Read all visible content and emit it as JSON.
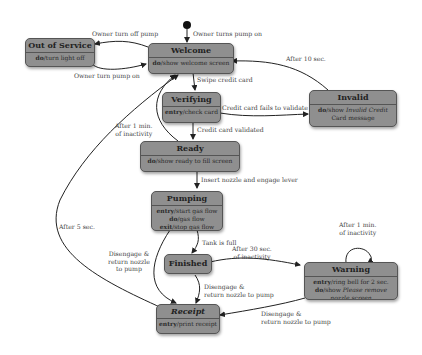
{
  "diagram": {
    "type": "state-machine",
    "initial_transition_label": "Owner turns pump on",
    "states": [
      {
        "id": "out_of_service",
        "name": "Out of Service",
        "actions": [
          {
            "kind": "do",
            "text": "turn light off"
          }
        ]
      },
      {
        "id": "welcome",
        "name": "Welcome",
        "actions": [
          {
            "kind": "do",
            "text": "show welcome screen"
          }
        ]
      },
      {
        "id": "verifying",
        "name": "Verifying",
        "actions": [
          {
            "kind": "entry",
            "text": "check card"
          }
        ]
      },
      {
        "id": "invalid",
        "name": "Invalid",
        "actions": [
          {
            "kind": "do",
            "text": "show ",
            "italic": "Invalid Credit Card",
            "suffix": " message"
          }
        ]
      },
      {
        "id": "ready",
        "name": "Ready",
        "actions": [
          {
            "kind": "do",
            "text": "show ready to fill screen"
          }
        ]
      },
      {
        "id": "pumping",
        "name": "Pumping",
        "actions": [
          {
            "kind": "entry",
            "text": "start gas flow"
          },
          {
            "kind": "do",
            "text": "gas flow"
          },
          {
            "kind": "exit",
            "text": "stop gas flow"
          }
        ]
      },
      {
        "id": "finished",
        "name": "Finished",
        "actions": []
      },
      {
        "id": "warning",
        "name": "Warning",
        "actions": [
          {
            "kind": "entry",
            "text": "ring bell for 2 sec."
          },
          {
            "kind": "do",
            "text": "show ",
            "italic": "Please remove nozzle screen"
          }
        ]
      },
      {
        "id": "receipt",
        "name": "Receipt",
        "actions": [
          {
            "kind": "entry",
            "text": "print receipt"
          }
        ]
      }
    ],
    "transitions": [
      {
        "from": "welcome",
        "to": "out_of_service",
        "label": "Owner turn off pump"
      },
      {
        "from": "out_of_service",
        "to": "welcome",
        "label": "Owner turn pump on"
      },
      {
        "from": "welcome",
        "to": "verifying",
        "label": "Swipe credit card"
      },
      {
        "from": "verifying",
        "to": "invalid",
        "label": "Credit card fails to validate"
      },
      {
        "from": "invalid",
        "to": "welcome",
        "label": "After 10 sec."
      },
      {
        "from": "verifying",
        "to": "ready",
        "label": "Credit card validated"
      },
      {
        "from": "ready",
        "to": "welcome",
        "label": "After 1 min. of inactivity"
      },
      {
        "from": "ready",
        "to": "pumping",
        "label": "Insert nozzle and engage lever"
      },
      {
        "from": "pumping",
        "to": "finished",
        "label": "Tank is full"
      },
      {
        "from": "pumping",
        "to": "receipt",
        "label": "Disengage & return nozzle to pump"
      },
      {
        "from": "finished",
        "to": "warning",
        "label": "After 30 sec. of inactivity"
      },
      {
        "from": "finished",
        "to": "receipt",
        "label": "Disengage & return nozzle to pump"
      },
      {
        "from": "warning",
        "to": "warning",
        "label": "After 1 min. of inactivity"
      },
      {
        "from": "warning",
        "to": "receipt",
        "label": "Disengage & return nozzle to pump"
      },
      {
        "from": "receipt",
        "to": "welcome",
        "label": "After 5 sec."
      }
    ]
  },
  "labels": {
    "owner_turns_on": "Owner turns pump on",
    "owner_turn_off": "Owner turn off pump",
    "owner_turn_on": "Owner turn pump on",
    "swipe": "Swipe credit card",
    "fails": "Credit card fails to validate",
    "after10": "After 10 sec.",
    "validated": "Credit card validated",
    "inactivity1_l1": "After 1 min.",
    "inactivity1_l2": "of inactivity",
    "insert": "Insert nozzle and engage lever",
    "tank_full": "Tank is full",
    "after30_l1": "After 30 sec.",
    "after30_l2": "of inactivity",
    "warn_loop_l1": "After 1 min.",
    "warn_loop_l2": "of inactivity",
    "diseng_left_l1": "Disengage &",
    "diseng_left_l2": "return nozzle",
    "diseng_left_l3": "to pump",
    "diseng_mid_l1": "Disengage &",
    "diseng_mid_l2": "return nozzle to pump",
    "diseng_right_l1": "Disengage &",
    "diseng_right_l2": "return nozzle to pump",
    "after5": "After 5 sec."
  },
  "boxes": {
    "out_of_service": {
      "title": "Out of Service",
      "kw": "do",
      "text": "/turn light off"
    },
    "welcome": {
      "title": "Welcome",
      "kw": "do",
      "text": "/show welcome screen"
    },
    "verifying": {
      "title": "Verifying",
      "kw": "entry",
      "text": "/check card"
    },
    "invalid": {
      "title": "Invalid",
      "kw": "do",
      "text": "/show ",
      "it1": "Invalid Credit",
      "line2": "Card message"
    },
    "ready": {
      "title": "Ready",
      "kw": "do",
      "text": "/show ready to fill screen"
    },
    "pumping": {
      "title": "Pumping",
      "kw1": "entry",
      "t1": "/start gas flow",
      "kw2": "do",
      "t2": "/gas flow",
      "kw3": "exit",
      "t3": "/stop gas flow"
    },
    "finished": {
      "title": "Finished"
    },
    "warning": {
      "title": "Warning",
      "kw1": "entry",
      "t1": "/ring bell for 2 sec.",
      "kw2": "do",
      "t2": "/show ",
      "it2": "Please remove",
      "line3": "nozzle screen"
    },
    "receipt": {
      "title": "Receipt",
      "kw": "entry",
      "text": "/print receipt"
    }
  }
}
